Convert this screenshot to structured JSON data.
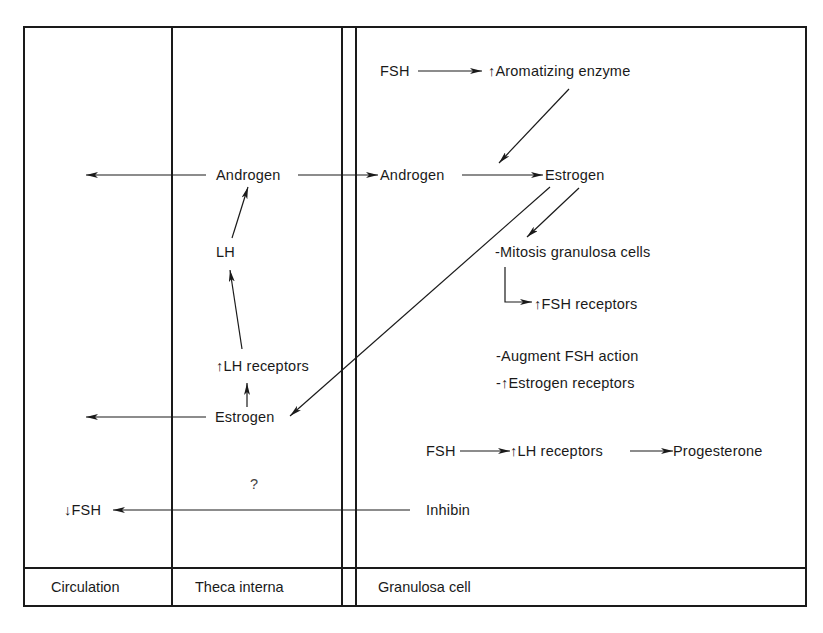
{
  "columns": {
    "circulation": "Circulation",
    "theca": "Theca interna",
    "granulosa": "Granulosa cell"
  },
  "nodes": {
    "fsh_top": "FSH",
    "aromatizing": "Aromatizing enzyme",
    "theca_androgen": "Androgen",
    "gran_androgen": "Androgen",
    "gran_estrogen": "Estrogen",
    "lh": "LH",
    "mitosis": "-Mitosis granulosa cells",
    "fsh_receptors": "FSH receptors",
    "lh_receptors_theca": "LH receptors",
    "augment": "-Augment FSH action",
    "estrogen_receptors_prefix": "-",
    "estrogen_receptors": "Estrogen receptors",
    "theca_estrogen": "Estrogen",
    "fsh_bottom": "FSH",
    "lh_receptors_gran": "LH receptors",
    "progesterone": "Progesterone",
    "question": "?",
    "fsh_circ": "FSH",
    "inhibin": "Inhibin"
  },
  "glyphs": {
    "up": "up-arrow-icon",
    "down": "down-arrow-icon"
  },
  "colors": {
    "ink": "#1a1a1a",
    "background": "#ffffff"
  }
}
